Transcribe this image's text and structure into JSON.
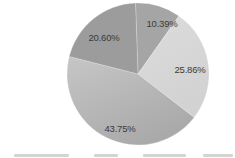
{
  "chart_data": {
    "type": "pie",
    "title": "",
    "categories": [
      "",
      "",
      "",
      ""
    ],
    "values": [
      10.39,
      25.86,
      43.75,
      20.6
    ],
    "labels": [
      "10.39%",
      "25.86%",
      "43.75%",
      "20.60%"
    ],
    "colors": [
      "#a5a5a5",
      "#d8d8d8",
      "#b6b6b6",
      "#9c9c9c"
    ],
    "start_angle_deg": -2,
    "direction": "clockwise",
    "legend_position": "bottom",
    "legend_visible_text": "truncated"
  },
  "layout": {
    "center": [
      138,
      74
    ],
    "radius": 71,
    "label_positions": [
      [
        162,
        27
      ],
      [
        190,
        73
      ],
      [
        120,
        132
      ],
      [
        104,
        41
      ]
    ]
  }
}
